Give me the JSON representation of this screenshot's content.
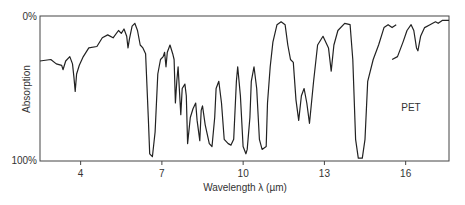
{
  "chart_data": {
    "type": "line",
    "title": "",
    "annotation": "PET",
    "xlabel": "Wavelength λ (µm)",
    "ylabel": "Absorption",
    "xlim": [
      2.5,
      17.6
    ],
    "ylim": [
      0,
      100
    ],
    "y_inverted": true,
    "grid": false,
    "legend": "none",
    "x_ticks": [
      4,
      7,
      10,
      13,
      16
    ],
    "x_tick_labels": [
      "4",
      "7",
      "10",
      "13",
      "16"
    ],
    "y_tick_labels": [
      "0%",
      "100%"
    ],
    "series": [
      {
        "name": "PET absorption spectrum (segment 1)",
        "points": [
          [
            2.5,
            31
          ],
          [
            2.9,
            30
          ],
          [
            3.1,
            33
          ],
          [
            3.3,
            34
          ],
          [
            3.35,
            37
          ],
          [
            3.45,
            31
          ],
          [
            3.6,
            28
          ],
          [
            3.7,
            33
          ],
          [
            3.75,
            42
          ],
          [
            3.8,
            52
          ],
          [
            3.85,
            40
          ],
          [
            3.95,
            34
          ],
          [
            4.1,
            28
          ],
          [
            4.3,
            22
          ],
          [
            4.6,
            21
          ],
          [
            4.8,
            15
          ],
          [
            5.0,
            13
          ],
          [
            5.2,
            15
          ],
          [
            5.4,
            10
          ],
          [
            5.5,
            12
          ],
          [
            5.6,
            9
          ],
          [
            5.7,
            14
          ],
          [
            5.75,
            22
          ],
          [
            5.8,
            16
          ],
          [
            5.9,
            7
          ],
          [
            6.0,
            5
          ],
          [
            6.1,
            10
          ],
          [
            6.2,
            20
          ],
          [
            6.3,
            22
          ],
          [
            6.4,
            26
          ],
          [
            6.5,
            70
          ],
          [
            6.55,
            95
          ],
          [
            6.65,
            97
          ],
          [
            6.75,
            80
          ],
          [
            6.85,
            40
          ],
          [
            6.95,
            30
          ],
          [
            7.05,
            28
          ],
          [
            7.1,
            25
          ],
          [
            7.15,
            35
          ],
          [
            7.2,
            25
          ],
          [
            7.3,
            20
          ],
          [
            7.4,
            26
          ],
          [
            7.45,
            30
          ],
          [
            7.5,
            60
          ],
          [
            7.55,
            45
          ],
          [
            7.6,
            35
          ],
          [
            7.7,
            68
          ],
          [
            7.75,
            50
          ],
          [
            7.85,
            47
          ],
          [
            7.9,
            55
          ],
          [
            7.95,
            88
          ],
          [
            8.05,
            70
          ],
          [
            8.15,
            64
          ],
          [
            8.25,
            60
          ],
          [
            8.3,
            72
          ],
          [
            8.4,
            86
          ],
          [
            8.45,
            65
          ],
          [
            8.5,
            62
          ],
          [
            8.6,
            75
          ],
          [
            8.75,
            88
          ],
          [
            8.85,
            90
          ],
          [
            8.95,
            70
          ],
          [
            9.0,
            50
          ],
          [
            9.1,
            45
          ],
          [
            9.2,
            60
          ],
          [
            9.3,
            85
          ],
          [
            9.45,
            88
          ],
          [
            9.55,
            89
          ],
          [
            9.65,
            85
          ],
          [
            9.75,
            45
          ],
          [
            9.8,
            35
          ],
          [
            9.9,
            55
          ],
          [
            10.0,
            90
          ],
          [
            10.1,
            95
          ],
          [
            10.15,
            92
          ],
          [
            10.25,
            70
          ],
          [
            10.3,
            45
          ],
          [
            10.4,
            35
          ],
          [
            10.5,
            50
          ],
          [
            10.6,
            85
          ],
          [
            10.7,
            92
          ],
          [
            10.85,
            90
          ],
          [
            10.9,
            60
          ],
          [
            11.0,
            35
          ],
          [
            11.1,
            18
          ],
          [
            11.25,
            6
          ],
          [
            11.4,
            4
          ],
          [
            11.55,
            6
          ],
          [
            11.65,
            20
          ],
          [
            11.75,
            30
          ],
          [
            11.85,
            32
          ],
          [
            11.95,
            58
          ],
          [
            12.05,
            72
          ],
          [
            12.15,
            55
          ],
          [
            12.25,
            50
          ],
          [
            12.35,
            60
          ],
          [
            12.45,
            74
          ],
          [
            12.6,
            45
          ],
          [
            12.75,
            20
          ],
          [
            12.95,
            14
          ],
          [
            13.15,
            22
          ],
          [
            13.25,
            38
          ],
          [
            13.35,
            20
          ],
          [
            13.5,
            10
          ],
          [
            13.75,
            5
          ],
          [
            13.95,
            6
          ],
          [
            14.05,
            30
          ],
          [
            14.15,
            85
          ],
          [
            14.25,
            98
          ],
          [
            14.4,
            98
          ],
          [
            14.5,
            85
          ],
          [
            14.6,
            45
          ],
          [
            14.8,
            30
          ],
          [
            15.0,
            20
          ],
          [
            15.2,
            8
          ],
          [
            15.35,
            6
          ],
          [
            15.5,
            8
          ],
          [
            15.65,
            6
          ]
        ]
      },
      {
        "name": "PET absorption spectrum (segment 2)",
        "points": [
          [
            15.5,
            30
          ],
          [
            15.7,
            28
          ],
          [
            15.9,
            18
          ],
          [
            16.05,
            10
          ],
          [
            16.2,
            6
          ],
          [
            16.3,
            10
          ],
          [
            16.4,
            22
          ],
          [
            16.45,
            24
          ],
          [
            16.55,
            14
          ],
          [
            16.7,
            8
          ],
          [
            16.9,
            6
          ],
          [
            17.0,
            5
          ],
          [
            17.1,
            4
          ],
          [
            17.2,
            5
          ],
          [
            17.35,
            3
          ],
          [
            17.6,
            3
          ]
        ]
      }
    ]
  }
}
